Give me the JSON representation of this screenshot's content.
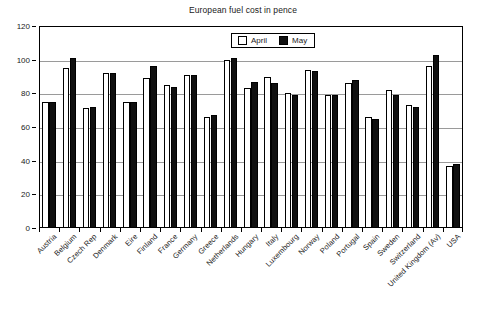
{
  "chart_data": {
    "type": "bar",
    "title": "European fuel cost in pence",
    "xlabel": "",
    "ylabel": "",
    "ylim": [
      0,
      120
    ],
    "ytick_step": 20,
    "yticks": [
      0,
      20,
      40,
      60,
      80,
      100,
      120
    ],
    "grid": true,
    "legend_position": "top-center-inside",
    "categories": [
      "Austria",
      "Belgium",
      "Czech Rep",
      "Denmark",
      "Eire",
      "Finland",
      "France",
      "Germany",
      "Greece",
      "Netherlands",
      "Hungary",
      "Italy",
      "Luxembourg",
      "Norway",
      "Poland",
      "Portugal",
      "Spain",
      "Sweden",
      "Switzerland",
      "United Kingdom (Av)",
      "USA"
    ],
    "series": [
      {
        "name": "April",
        "color": "#ffffff",
        "values": [
          75,
          95,
          71,
          92,
          75,
          89,
          85,
          91,
          66,
          100,
          83,
          90,
          80,
          94,
          79,
          86,
          66,
          82,
          73,
          96,
          37
        ]
      },
      {
        "name": "May",
        "color": "#101010",
        "values": [
          75,
          101,
          72,
          92,
          75,
          96,
          84,
          91,
          67,
          101,
          87,
          86,
          79,
          93,
          79,
          88,
          65,
          79,
          72,
          103,
          38
        ]
      }
    ]
  },
  "legend": {
    "items": [
      {
        "label": "April"
      },
      {
        "label": "May"
      }
    ]
  }
}
